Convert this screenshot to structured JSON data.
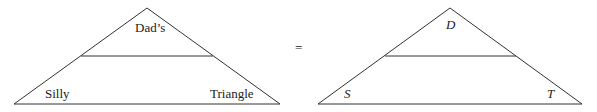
{
  "left_triangle": {
    "top": "Dad’s",
    "bottom_left": "Silly",
    "bottom_right": "Triangle"
  },
  "equals": "=",
  "right_triangle": {
    "top": "D",
    "bottom_left": "S",
    "bottom_right": "T"
  },
  "colors": {
    "stroke": "#333333",
    "text": "#222222"
  }
}
